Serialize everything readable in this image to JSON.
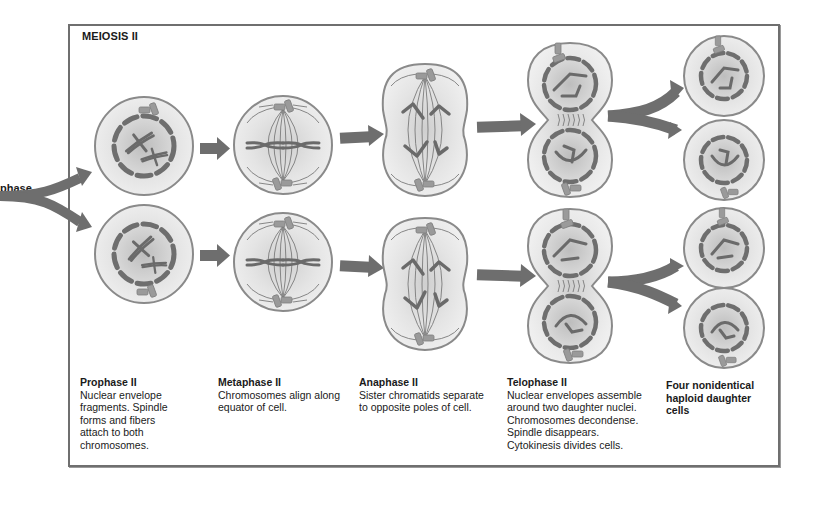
{
  "diagram": {
    "title": "MEIOSIS II",
    "incoming_label": "phase",
    "colors": {
      "frame": "#6f6f6f",
      "arrow": "#6e6e6e",
      "cell_fill": "#e6e6e6",
      "cell_outline": "#8a8a8a",
      "chromosome": "#6a6a6a",
      "nuclear_envelope": "#6e6e6e",
      "centriole": "#9a9a9a",
      "spindle": "#7a7a7a"
    },
    "stages": [
      {
        "id": "prophase-ii",
        "heading": "Prophase II",
        "description": "Nuclear envelope\nfragments. Spindle\nforms and fibers\nattach to both\nchromosomes."
      },
      {
        "id": "metaphase-ii",
        "heading": "Metaphase II",
        "description": "Chromosomes align along\nequator of cell."
      },
      {
        "id": "anaphase-ii",
        "heading": "Anaphase II",
        "description": "Sister chromatids separate\nto opposite poles of cell."
      },
      {
        "id": "telophase-ii",
        "heading": "Telophase II",
        "description": "Nuclear envelopes assemble\naround two daughter nuclei.\nChromosomes decondense.\nSpindle disappears.\nCytokinesis divides cells."
      },
      {
        "id": "daughter-cells",
        "heading": "",
        "description": "Four nonidentical\nhaploid daughter\ncells"
      }
    ],
    "flow": [
      "phase → Prophase II (×2 branches)",
      "Prophase II → Metaphase II",
      "Metaphase II → Anaphase II",
      "Anaphase II → Telophase II",
      "Telophase II → Four daughter cells (each splits into 2)"
    ]
  }
}
